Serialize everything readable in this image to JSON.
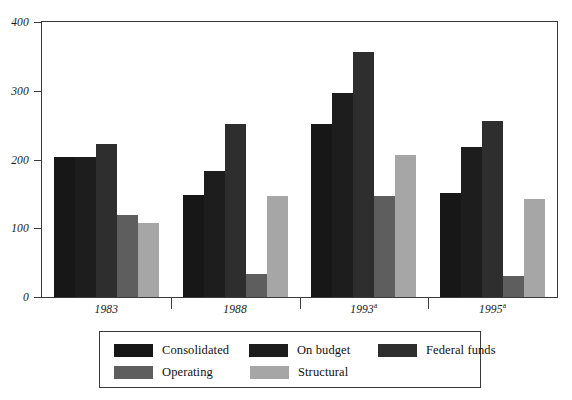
{
  "chart_data": {
    "type": "bar",
    "title": "",
    "subtitle": "",
    "xlabel": "",
    "ylabel": "",
    "categories": [
      "1983",
      "1988",
      "1993a",
      "1995a"
    ],
    "category_labels": [
      {
        "text": "1983",
        "superscript": ""
      },
      {
        "text": "1988",
        "superscript": ""
      },
      {
        "text": "1993",
        "superscript": "a"
      },
      {
        "text": "1995",
        "superscript": "a"
      }
    ],
    "series": [
      {
        "name": "Consolidated",
        "color": "#171717",
        "values": [
          203,
          148,
          252,
          152
        ]
      },
      {
        "name": "On budget",
        "color": "#1d1d1d",
        "values": [
          203,
          183,
          297,
          218
        ]
      },
      {
        "name": "Federal funds",
        "color": "#2e2e2e",
        "values": [
          222,
          252,
          356,
          256
        ]
      },
      {
        "name": "Operating",
        "color": "#5e5e5e",
        "values": [
          120,
          33,
          147,
          30
        ]
      },
      {
        "name": "Structural",
        "color": "#a6a6a6",
        "values": [
          108,
          147,
          206,
          142
        ]
      }
    ],
    "ylim": [
      0,
      400
    ],
    "yticks": [
      0,
      100,
      200,
      300,
      400
    ],
    "ytick_labels": [
      "0",
      "100",
      "200",
      "300",
      "400"
    ],
    "grid": false,
    "legend_position": "bottom",
    "legend_entries": [
      {
        "label": "Consolidated",
        "color": "#171717"
      },
      {
        "label": "On budget",
        "color": "#1d1d1d"
      },
      {
        "label": "Federal funds",
        "color": "#2e2e2e"
      },
      {
        "label": "Operating",
        "color": "#5e5e5e"
      },
      {
        "label": "Structural",
        "color": "#a6a6a6"
      }
    ]
  }
}
